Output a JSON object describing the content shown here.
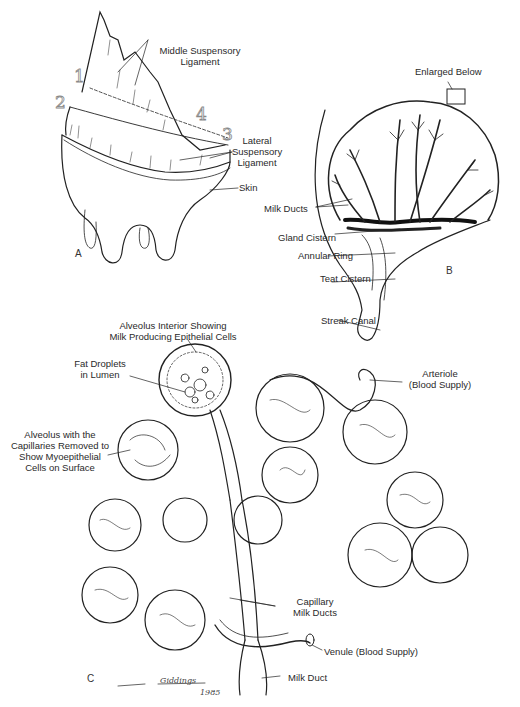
{
  "figure": {
    "panels": [
      {
        "id": "A",
        "label": "A"
      },
      {
        "id": "B",
        "label": "B"
      },
      {
        "id": "C",
        "label": "C"
      }
    ],
    "panel_a": {
      "numbers": [
        "1",
        "2",
        "3",
        "4"
      ],
      "labels": {
        "middle_suspensory_1": "Middle Suspensory",
        "middle_suspensory_2": "Ligament",
        "lateral_1": "Lateral",
        "lateral_2": "Suspensory",
        "lateral_3": "Ligament",
        "skin": "Skin"
      }
    },
    "panel_b": {
      "labels": {
        "enlarged_below": "Enlarged Below",
        "milk_ducts": "Milk Ducts",
        "gland_cistern": "Gland Cistern",
        "annular_ring": "Annular Ring",
        "teat_cistern": "Teat Cistern",
        "streak_canal": "Streak Canal"
      }
    },
    "panel_c": {
      "labels": {
        "alveolus_interior_1": "Alveolus Interior Showing",
        "alveolus_interior_2": "Milk Producing Epithelial Cells",
        "fat_droplets_1": "Fat Droplets",
        "fat_droplets_2": "in Lumen",
        "alveolus_removed_1": "Alveolus with the",
        "alveolus_removed_2": "Capillaries Removed to",
        "alveolus_removed_3": "Show Myoepithelial",
        "alveolus_removed_4": "Cells on Surface",
        "arteriole_1": "Arteriole",
        "arteriole_2": "(Blood Supply)",
        "capillary_1": "Capillary",
        "capillary_2": "Milk Ducts",
        "venule": "Venule (Blood Supply)",
        "milk_duct": "Milk Duct"
      }
    },
    "signature": {
      "name": "Giddings",
      "year": "1985"
    }
  }
}
